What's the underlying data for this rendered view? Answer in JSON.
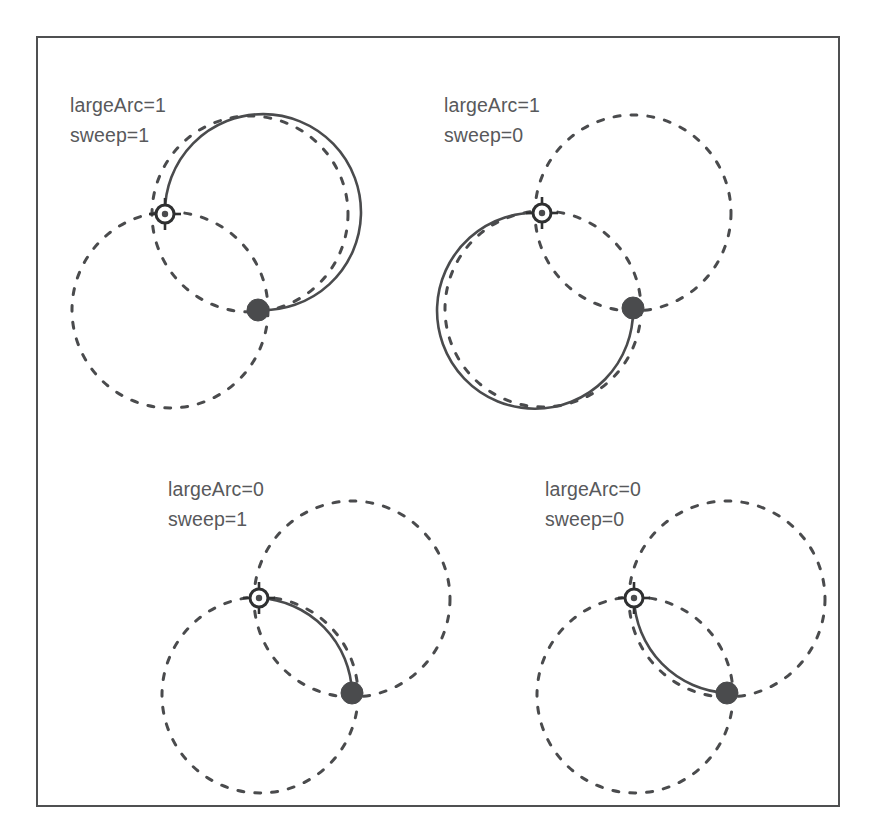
{
  "figure": {
    "frame": {
      "x": 36,
      "y": 36,
      "width": 804,
      "height": 771,
      "stroke": "#4f5051",
      "stroke_width": 2
    },
    "canvas": {
      "width": 875,
      "height": 837,
      "background": "#ffffff"
    },
    "colors": {
      "ink": "#4a4b4d",
      "label": "#58595b",
      "frame": "#4f5051",
      "marker_fill": "#4a4b4d",
      "marker_ring": "#2f3031",
      "background": "#ffffff"
    },
    "style": {
      "ghost_circle_dash": "6 11",
      "ghost_circle_stroke_width": 3,
      "arc_stroke_width": 2.6,
      "radius": 98
    }
  },
  "panels": [
    {
      "id": "panel-large1-sweep1",
      "label_line1": "largeArc=1",
      "label_line2": "sweep=1",
      "label_x": 70,
      "label_y": 112,
      "large_arc_flag": 1,
      "sweep_flag": 1,
      "radius": 98,
      "start": {
        "x": 165,
        "y": 214
      },
      "end": {
        "x": 258,
        "y": 310
      },
      "arc_center": {
        "x": 250,
        "y": 214
      },
      "ghost_centers": [
        {
          "x": 170,
          "y": 310,
          "dashed": true
        },
        {
          "x": 250,
          "y": 214,
          "dashed": true
        }
      ],
      "arc_d": "M 165 214 A 98 98 0 1 1 258 310"
    },
    {
      "id": "panel-large1-sweep0",
      "label_line1": "largeArc=1",
      "label_line2": "sweep=0",
      "label_x": 444,
      "label_y": 112,
      "large_arc_flag": 1,
      "sweep_flag": 0,
      "radius": 98,
      "start": {
        "x": 542,
        "y": 213
      },
      "end": {
        "x": 633,
        "y": 308
      },
      "arc_center": {
        "x": 543,
        "y": 309
      },
      "ghost_centers": [
        {
          "x": 543,
          "y": 309,
          "dashed": true
        },
        {
          "x": 633,
          "y": 213,
          "dashed": true
        }
      ],
      "arc_d": "M 542 213 A 98 98 0 1 0 633 308"
    },
    {
      "id": "panel-large0-sweep1",
      "label_line1": "largeArc=0",
      "label_line2": "sweep=1",
      "label_x": 168,
      "label_y": 496,
      "large_arc_flag": 0,
      "sweep_flag": 1,
      "radius": 98,
      "start": {
        "x": 259,
        "y": 598
      },
      "end": {
        "x": 352,
        "y": 693
      },
      "arc_center": {
        "x": 260,
        "y": 695
      },
      "ghost_centers": [
        {
          "x": 260,
          "y": 695,
          "dashed": true
        },
        {
          "x": 352,
          "y": 599,
          "dashed": true
        }
      ],
      "arc_d": "M 259 598 A 98 98 0 0 1 352 693"
    },
    {
      "id": "panel-large0-sweep0",
      "label_line1": "largeArc=0",
      "label_line2": "sweep=0",
      "label_x": 545,
      "label_y": 496,
      "large_arc_flag": 0,
      "sweep_flag": 0,
      "radius": 98,
      "start": {
        "x": 634,
        "y": 598
      },
      "end": {
        "x": 727,
        "y": 693
      },
      "arc_center": {
        "x": 727,
        "y": 599
      },
      "ghost_centers": [
        {
          "x": 635,
          "y": 695,
          "dashed": true
        },
        {
          "x": 727,
          "y": 599,
          "dashed": true
        }
      ],
      "arc_d": "M 634 598 A 98 98 0 0 0 727 693"
    }
  ],
  "markers": {
    "start_name": "arc-start-point",
    "end_name": "arc-end-point",
    "start_outer_radius": 9,
    "start_inner_radius": 3.2,
    "end_radius": 11,
    "tick_length": 7
  }
}
